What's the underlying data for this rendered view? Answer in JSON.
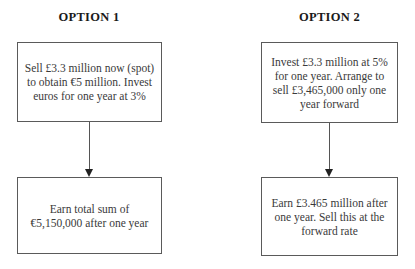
{
  "options": [
    {
      "heading": "OPTION 1",
      "top_box": "Sell £3.3 million now (spot) to obtain €5 million. Invest euros for one year at 3%",
      "bottom_box": "Earn total sum of €5,150,000 after one year"
    },
    {
      "heading": "OPTION 2",
      "top_box": "Invest £3.3 million at 5% for one year. Arrange to sell £3,465,000 only one year forward",
      "bottom_box": "Earn £3.465 million after one year. Sell this at the forward rate"
    }
  ],
  "colors": {
    "border": "#5a5a5a",
    "text": "#3a3a3a",
    "heading": "#1a1a1a",
    "arrow": "#222222"
  }
}
